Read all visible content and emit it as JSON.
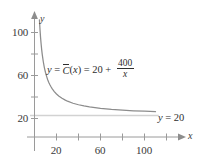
{
  "chart_data": {
    "type": "line",
    "title": "",
    "xlabel": "x",
    "ylabel": "y",
    "xlim": [
      0,
      135
    ],
    "ylim": [
      0,
      120
    ],
    "grid": false,
    "legend_position": "none",
    "x_ticks": [
      20,
      60,
      100
    ],
    "x_ticks_unlabeled": [
      40,
      80,
      120
    ],
    "y_ticks": [
      20,
      60,
      100
    ],
    "y_ticks_unlabeled": [
      40,
      80
    ],
    "annotations": [
      {
        "name": "curve-equation",
        "text": "y = C(x) = 20 + 400/x",
        "x": 47,
        "y": 59
      },
      {
        "name": "asymptote-equation",
        "text": "y = 20",
        "x": 158,
        "y": 112
      }
    ],
    "series": [
      {
        "name": "y = C-bar(x) = 20 + 400/x",
        "type": "line",
        "color": "#8c8c8c",
        "formula": "20 + 400/x",
        "x": [
          3.6,
          4,
          4.5,
          5,
          5.5,
          6,
          6.5,
          7,
          8,
          9,
          10,
          11,
          12,
          13,
          14,
          15,
          16,
          18,
          20,
          22,
          25,
          28,
          30,
          35,
          40,
          45,
          50,
          60,
          70,
          80,
          90,
          100,
          110,
          120,
          130
        ],
        "y": [
          131.1,
          120,
          108.9,
          100,
          92.7,
          86.7,
          81.5,
          77.1,
          70,
          64.4,
          60,
          56.4,
          53.3,
          50.8,
          48.6,
          46.7,
          45,
          42.2,
          40,
          38.2,
          36,
          34.3,
          33.3,
          31.4,
          30,
          28.9,
          28,
          26.7,
          25.7,
          25,
          24.4,
          24,
          23.6,
          23.3,
          23.1
        ]
      },
      {
        "name": "y = 20 asymptote",
        "type": "hline",
        "color": "#cfcfcf",
        "value": 20,
        "x_range": [
          0,
          113
        ]
      }
    ]
  },
  "axes": {
    "y_axis_label": "y",
    "x_axis_label": "x",
    "y_tick_labels": [
      "100",
      "60",
      "20"
    ],
    "x_tick_labels": [
      "20",
      "60",
      "100"
    ]
  },
  "equation": {
    "lhs_y": "y",
    "equals_1": "=",
    "fn_name": "C",
    "fn_arg_open": "(",
    "fn_arg": "x",
    "fn_arg_close": ")",
    "equals_2": "=",
    "constant": "20",
    "plus": "+",
    "numerator": "400",
    "denominator": "x"
  },
  "asymptote": {
    "var": "y",
    "equals": "=",
    "value": "20"
  },
  "colors": {
    "curve": "#8c8c8c",
    "asymptote_line": "#cfcfcf",
    "axis": "#9a9a9a",
    "text": "#3a3a3a",
    "background": "#ffffff"
  }
}
